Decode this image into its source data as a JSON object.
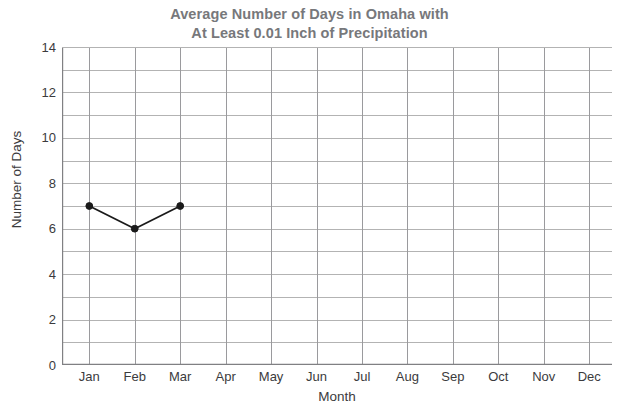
{
  "chart_data": {
    "type": "line",
    "title": "Average Number of Days in Omaha with At Least 0.01 Inch of Precipitation",
    "title_lines": [
      "Average Number of Days in Omaha with",
      "At Least 0.01 Inch of Precipitation"
    ],
    "xlabel": "Month",
    "ylabel": "Number of Days",
    "categories": [
      "Jan",
      "Feb",
      "Mar",
      "Apr",
      "May",
      "Jun",
      "Jul",
      "Aug",
      "Sep",
      "Oct",
      "Nov",
      "Dec"
    ],
    "values": [
      7,
      6,
      7,
      null,
      null,
      null,
      null,
      null,
      null,
      null,
      null,
      null
    ],
    "series": [
      {
        "name": "Average Number of Days with At Least 0.01 Inch of Precipitation",
        "points": [
          {
            "x": "Jan",
            "y": 7
          },
          {
            "x": "Feb",
            "y": 6
          },
          {
            "x": "Mar",
            "y": 7
          }
        ]
      }
    ],
    "ylim": [
      0,
      14
    ],
    "y_tick_labels": [
      "0",
      "2",
      "4",
      "6",
      "8",
      "10",
      "12",
      "14"
    ],
    "y_tick_values": [
      0,
      2,
      4,
      6,
      8,
      10,
      12,
      14
    ],
    "y_major_step": 2,
    "y_minor_step": 1,
    "grid": true,
    "grid_horizontal": true,
    "grid_vertical": true,
    "legend": false,
    "legend_position": "none",
    "marker": "circle",
    "colors": {
      "title": "#77787b",
      "axis_text": "#3b3b3d",
      "grid_line": "#b3b3b3",
      "axis_line": "#808083",
      "series_line": "#1a1a1a",
      "marker_fill": "#1a1a1a",
      "background": "#ffffff"
    }
  }
}
